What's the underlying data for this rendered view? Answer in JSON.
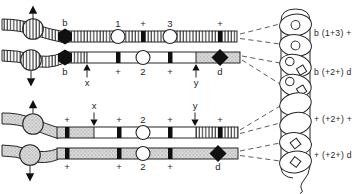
{
  "colors": {
    "ink": "#262626",
    "marker_black": "#101010",
    "gray_fill": "#d9d9d9",
    "background": "#ffffff"
  },
  "top_chromatid_pair": {
    "spindle_arrows": [
      "up",
      "down"
    ],
    "strand1_markers": [
      "b",
      "1",
      "+",
      "3",
      "+"
    ],
    "strand2_markers": [
      "b",
      "+",
      "2",
      "+",
      "d"
    ],
    "strand2_sites": [
      "x",
      "y"
    ]
  },
  "bottom_chromatid_pair": {
    "spindle_arrows": [
      "up",
      "down"
    ],
    "strand3_markers": [
      "+",
      "+",
      "2",
      "+",
      "+"
    ],
    "strand3_sites": [
      "x",
      "y"
    ],
    "strand4_markers": [
      "+",
      "+",
      "2",
      "+",
      "d"
    ]
  },
  "ascus": {
    "spore_count": 8,
    "spore_contents": [
      "circle",
      "circle",
      "circle+diamond",
      "circle+diamond",
      "empty",
      "empty",
      "diamond",
      "diamond"
    ],
    "genotype_labels": [
      "b (1+3) +",
      "b (+2+) d",
      "+ (+2+) +",
      "+ (+2+) d"
    ]
  }
}
